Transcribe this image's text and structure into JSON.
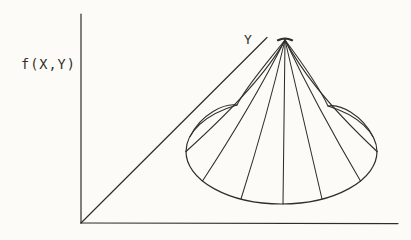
{
  "figure": {
    "z_axis_label": "f(X,Y)",
    "y_axis_label": "Y",
    "type": "3d-surface-sketch",
    "description_visible_elements": {
      "vertical_axis": "unticked line labeled f(X,Y)",
      "horizontal_axis": "unticked unlabeled baseline",
      "diagonal_axis": "unticked line labeled Y",
      "surface": "bell-shaped ruled surface over elliptical base"
    }
  },
  "colors": {
    "ink": "#2f2e2a",
    "paper": "#fcfbf8"
  }
}
